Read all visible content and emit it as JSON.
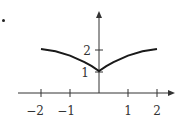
{
  "chart_data": {
    "type": "line",
    "title": "",
    "xlabel": "",
    "ylabel": "",
    "x_ticks": [
      "−2",
      "−1",
      "1",
      "2"
    ],
    "x_tick_values": [
      -2,
      -1,
      1,
      2
    ],
    "y_ticks": [
      "1",
      "2"
    ],
    "y_tick_values": [
      1,
      2
    ],
    "xlim": [
      -2.6,
      2.6
    ],
    "ylim": [
      0,
      3
    ],
    "grid": false,
    "series": [
      {
        "name": "f(x)",
        "x": [
          -2,
          -1.5,
          -1,
          -0.5,
          -0.25,
          0,
          0.25,
          0.5,
          1,
          1.5,
          2
        ],
        "y": [
          2.0,
          1.9,
          1.7,
          1.4,
          1.22,
          1.0,
          1.22,
          1.4,
          1.7,
          1.9,
          2.0
        ]
      }
    ]
  },
  "labels": {
    "x_neg2": "−2",
    "x_neg1": "−1",
    "x_1": "1",
    "x_2": "2",
    "y_1": "1",
    "y_2": "2"
  }
}
